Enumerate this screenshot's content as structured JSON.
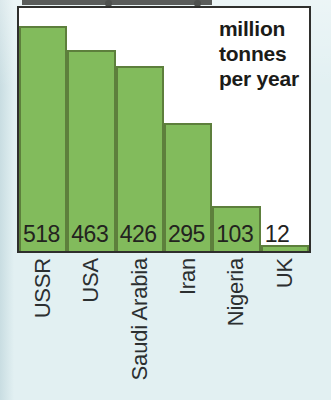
{
  "caption": {
    "line1": "million",
    "line2": "tonnes",
    "line3": "per year"
  },
  "colors": {
    "bar_fill": "#82bb5c",
    "bar_border": "#5d7f3c",
    "frame_border": "#2f2f2d",
    "page_background": "#e2f0f2",
    "plot_background": "#ffffff",
    "text": "#23231f"
  },
  "chart_data": {
    "type": "bar",
    "title": "",
    "subtitle": "",
    "xlabel": "",
    "ylabel": "million tonnes per year",
    "categories": [
      "USSR",
      "USA",
      "Saudi Arabia",
      "Iran",
      "Nigeria",
      "UK"
    ],
    "values": [
      518,
      463,
      426,
      295,
      103,
      12
    ],
    "value_labels": [
      "518",
      "463",
      "426",
      "295",
      "103",
      "12"
    ],
    "ylim": [
      0,
      560
    ],
    "grid": false,
    "legend": null,
    "annotations": [
      "million tonnes per year"
    ],
    "series": [
      {
        "name": "Oil production",
        "values": [
          518,
          463,
          426,
          295,
          103,
          12
        ]
      }
    ]
  }
}
